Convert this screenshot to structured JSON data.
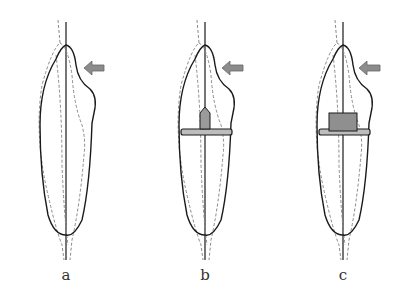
{
  "figure": {
    "panels": [
      {
        "id": "a",
        "label": "a",
        "description": "Tooth outline with labial force arrow, no restoration"
      },
      {
        "id": "b",
        "label": "b",
        "description": "Tooth with small cast post and core band"
      },
      {
        "id": "c",
        "label": "c",
        "description": "Tooth with larger square core block and band"
      }
    ],
    "colors": {
      "outline": "#1a1a1a",
      "dashed": "#8a8a8a",
      "arrow_fill": "#8c8c8c",
      "arrow_stroke": "#666666",
      "post_fill": "#9a9a9a",
      "band_fill": "#bdbdbd"
    }
  }
}
